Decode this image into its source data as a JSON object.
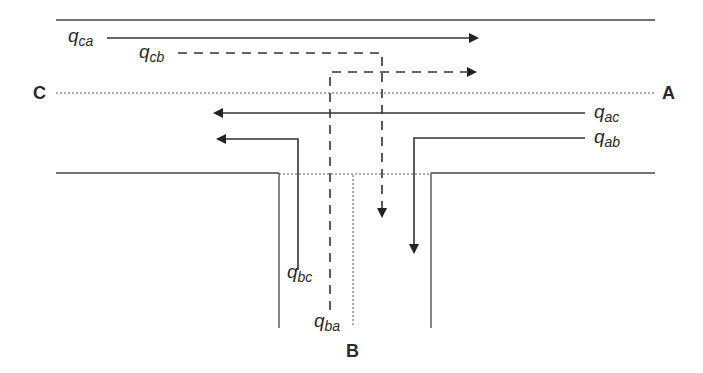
{
  "diagram": {
    "type": "T-junction traffic flow diagram",
    "colors": {
      "line": "#3a3a3a",
      "arrow": "#222222",
      "background": "#ffffff"
    },
    "nodes": {
      "A": {
        "label": "A",
        "position": "right (major road east)"
      },
      "B": {
        "label": "B",
        "position": "bottom (minor road)"
      },
      "C": {
        "label": "C",
        "position": "left (major road west)"
      }
    },
    "flows": [
      {
        "id": "q_ca",
        "base": "q",
        "sub": "ca",
        "style": "solid",
        "description": "C to A, straight"
      },
      {
        "id": "q_cb",
        "base": "q",
        "sub": "cb",
        "style": "dashed",
        "description": "C to B, right turn"
      },
      {
        "id": "q_ac",
        "base": "q",
        "sub": "ac",
        "style": "solid",
        "description": "A to C, straight"
      },
      {
        "id": "q_ab",
        "base": "q",
        "sub": "ab",
        "style": "solid",
        "description": "A to B, left turn"
      },
      {
        "id": "q_bc",
        "base": "q",
        "sub": "bc",
        "style": "solid",
        "description": "B to C, left turn"
      },
      {
        "id": "q_ba",
        "base": "q",
        "sub": "ba",
        "style": "dashed",
        "description": "B to A, right turn"
      }
    ]
  }
}
